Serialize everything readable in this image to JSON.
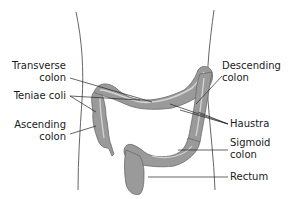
{
  "diagram": {
    "colors": {
      "organ_fill": "#9a9a9a",
      "organ_highlight": "#d4d4d4",
      "organ_stroke": "#6a6a6a",
      "body_outline": "#555555",
      "leader_line": "#222222",
      "text": "#1a1a1a"
    },
    "labels": {
      "transverse_colon": {
        "line1": "Transverse",
        "line2": "colon"
      },
      "teniae_coli": {
        "line1": "Teniae coli"
      },
      "ascending_colon": {
        "line1": "Ascending",
        "line2": "colon"
      },
      "descending_colon": {
        "line1": "Descending",
        "line2": "colon"
      },
      "haustra": {
        "line1": "Haustra"
      },
      "sigmoid_colon": {
        "line1": "Sigmoid",
        "line2": "colon"
      },
      "rectum": {
        "line1": "Rectum"
      }
    }
  }
}
